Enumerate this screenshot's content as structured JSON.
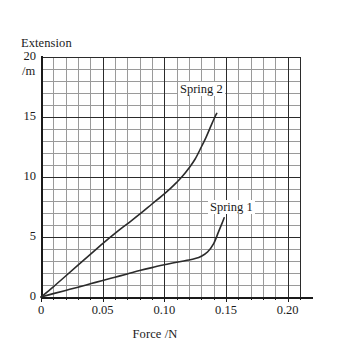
{
  "chart_data": {
    "type": "line",
    "title": "",
    "xlabel": "Force /N",
    "ylabel": "Extension /m",
    "ylabel_lines": [
      "Extension",
      "/m"
    ],
    "xlim": [
      0,
      0.215
    ],
    "ylim": [
      0,
      20
    ],
    "xticks": [
      0,
      0.05,
      0.1,
      0.15,
      0.2
    ],
    "xtick_labels": [
      "0",
      "0.05",
      "0.10",
      "0.15",
      "0.20"
    ],
    "yticks": [
      0,
      5,
      10,
      15,
      20
    ],
    "ytick_labels": [
      "0",
      "5",
      "10",
      "15",
      "20"
    ],
    "x_minor_step": 0.01,
    "y_minor_step": 1,
    "grid": true,
    "grid_major_color": "#2b2b2b",
    "grid_minor_color": "#9a9a9a",
    "axis_color": "#1a1a1a",
    "curve_color": "#2b2b2b",
    "legend_position": "inline-annotations",
    "series": [
      {
        "name": "Spring 1",
        "label": "Spring 1",
        "label_x": 0.152,
        "label_y": 8.2,
        "x": [
          0,
          0.01,
          0.02,
          0.03,
          0.04,
          0.05,
          0.06,
          0.07,
          0.08,
          0.09,
          0.1,
          0.11,
          0.12,
          0.125,
          0.13,
          0.135,
          0.14,
          0.144,
          0.147,
          0.1485
        ],
        "y": [
          0,
          0.28,
          0.55,
          0.82,
          1.1,
          1.38,
          1.65,
          1.92,
          2.2,
          2.45,
          2.68,
          2.9,
          3.08,
          3.2,
          3.4,
          3.75,
          4.45,
          5.45,
          6.2,
          6.6
        ]
      },
      {
        "name": "Spring 2",
        "label": "Spring 2",
        "label_x": 0.113,
        "label_y": 17.1,
        "x": [
          0,
          0.01,
          0.02,
          0.03,
          0.04,
          0.05,
          0.06,
          0.07,
          0.08,
          0.09,
          0.1,
          0.105,
          0.11,
          0.115,
          0.12,
          0.125,
          0.13,
          0.134,
          0.138,
          0.141,
          0.1425
        ],
        "y": [
          0,
          0.85,
          1.75,
          2.65,
          3.55,
          4.45,
          5.3,
          6.1,
          6.9,
          7.75,
          8.6,
          9.05,
          9.55,
          10.1,
          10.75,
          11.5,
          12.5,
          13.35,
          14.3,
          15.0,
          15.3
        ]
      }
    ]
  }
}
